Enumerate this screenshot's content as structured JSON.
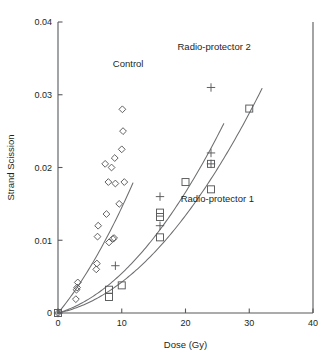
{
  "chart_data": {
    "type": "scatter",
    "title": "",
    "xlabel": "Dose (Gy)",
    "ylabel": "Strand Scission",
    "xlim": [
      0,
      40
    ],
    "ylim": [
      0,
      0.04
    ],
    "xticks": [
      0,
      10,
      20,
      30,
      40
    ],
    "xtick_labels": [
      "0",
      "10",
      "20",
      "30",
      "40"
    ],
    "yticks": [
      0,
      0.01,
      0.02,
      0.03,
      0.04
    ],
    "ytick_labels": [
      "0",
      "0.01",
      "0.02",
      "0.03",
      "0.04"
    ],
    "grid": false,
    "legend": "inline-annotations",
    "series": [
      {
        "name": "Control",
        "marker": "diamond",
        "annotation": "Control",
        "annotation_x": 11.0,
        "annotation_y": 0.0338,
        "points": [
          {
            "x": 0.0,
            "y": 0.0
          },
          {
            "x": 2.8,
            "y": 0.0019
          },
          {
            "x": 2.9,
            "y": 0.0032
          },
          {
            "x": 3.0,
            "y": 0.0035
          },
          {
            "x": 3.1,
            "y": 0.0042
          },
          {
            "x": 6.0,
            "y": 0.006
          },
          {
            "x": 6.1,
            "y": 0.0068
          },
          {
            "x": 6.2,
            "y": 0.0105
          },
          {
            "x": 6.3,
            "y": 0.012
          },
          {
            "x": 8.0,
            "y": 0.0097
          },
          {
            "x": 8.6,
            "y": 0.0102
          },
          {
            "x": 8.8,
            "y": 0.0103
          },
          {
            "x": 7.6,
            "y": 0.0136
          },
          {
            "x": 9.6,
            "y": 0.015
          },
          {
            "x": 7.9,
            "y": 0.018
          },
          {
            "x": 9.0,
            "y": 0.0178
          },
          {
            "x": 10.4,
            "y": 0.018
          },
          {
            "x": 7.4,
            "y": 0.0205
          },
          {
            "x": 8.9,
            "y": 0.0213
          },
          {
            "x": 8.4,
            "y": 0.02
          },
          {
            "x": 10.0,
            "y": 0.0225
          },
          {
            "x": 10.2,
            "y": 0.025
          },
          {
            "x": 10.1,
            "y": 0.028
          }
        ],
        "fit": {
          "a": 4e-05,
          "b": 0.00105,
          "c": 0.0
        }
      },
      {
        "name": "Radio-protector 2",
        "marker": "plus",
        "annotation": "Radio-protector 2",
        "annotation_x": 24.5,
        "annotation_y": 0.0362,
        "points": [
          {
            "x": 0.0,
            "y": 0.0
          },
          {
            "x": 9.0,
            "y": 0.0065
          },
          {
            "x": 16.0,
            "y": 0.016
          },
          {
            "x": 16.0,
            "y": 0.012
          },
          {
            "x": 24.0,
            "y": 0.0205
          },
          {
            "x": 24.0,
            "y": 0.022
          },
          {
            "x": 24.0,
            "y": 0.031
          }
        ],
        "fit": {
          "a": 2.85e-05,
          "b": 0.00026,
          "c": 0.0
        }
      },
      {
        "name": "Radio-protector 1",
        "marker": "square",
        "annotation": "Radio-protector 1",
        "annotation_x": 25.0,
        "annotation_y": 0.0152,
        "points": [
          {
            "x": 0.0,
            "y": 0.0
          },
          {
            "x": 8.0,
            "y": 0.0022
          },
          {
            "x": 8.0,
            "y": 0.0032
          },
          {
            "x": 10.0,
            "y": 0.0038
          },
          {
            "x": 16.0,
            "y": 0.0104
          },
          {
            "x": 16.0,
            "y": 0.0132
          },
          {
            "x": 16.0,
            "y": 0.0138
          },
          {
            "x": 20.0,
            "y": 0.018
          },
          {
            "x": 24.0,
            "y": 0.017
          },
          {
            "x": 24.0,
            "y": 0.0205
          },
          {
            "x": 30.0,
            "y": 0.0281
          }
        ],
        "fit": {
          "a": 2.45e-05,
          "b": 0.00018,
          "c": 0.0
        }
      }
    ]
  },
  "colors": {
    "axis": "#58595b",
    "curve": "#6d6e71",
    "marker": "#58595b",
    "text": "#231f20",
    "background": "#ffffff"
  }
}
